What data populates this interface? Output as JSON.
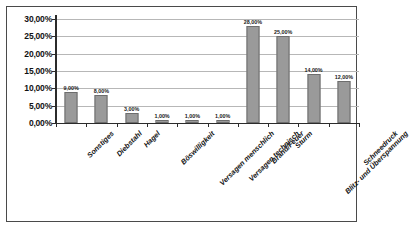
{
  "chart_data": {
    "type": "bar",
    "title": "",
    "subtitle": "",
    "xlabel": "",
    "ylabel": "",
    "ylim": [
      0,
      30
    ],
    "ytick_labels": [
      "30,00%",
      "25,00%",
      "20,00%",
      "15,00%",
      "10,00%",
      "5,00%",
      "0,00%"
    ],
    "ytick_values": [
      30,
      25,
      20,
      15,
      10,
      5,
      0
    ],
    "grid": true,
    "legend": "none",
    "bar_color": "#9a9a9a",
    "bar_border_color": "#6d6d6d",
    "gridline_color": "#b7b7b7",
    "axis_color": "#2b2b2b",
    "frame_color": "#4a4a4a",
    "categories": [
      "Sonstiges",
      "Diebstahl",
      "Hagel",
      "Böswilligkeit",
      "Versagen menschlich",
      "Versagen technisch",
      "Brand/Feuer",
      "Sturm",
      "Blitz- und Überspannung",
      "Schneedruck"
    ],
    "values": [
      9,
      8,
      3,
      1,
      1,
      1,
      28,
      25,
      14,
      12
    ],
    "value_labels": [
      "9,00%",
      "8,00%",
      "3,00%",
      "1,00%",
      "1,00%",
      "1,00%",
      "28,00%",
      "25,00%",
      "14,00%",
      "12,00%"
    ]
  }
}
